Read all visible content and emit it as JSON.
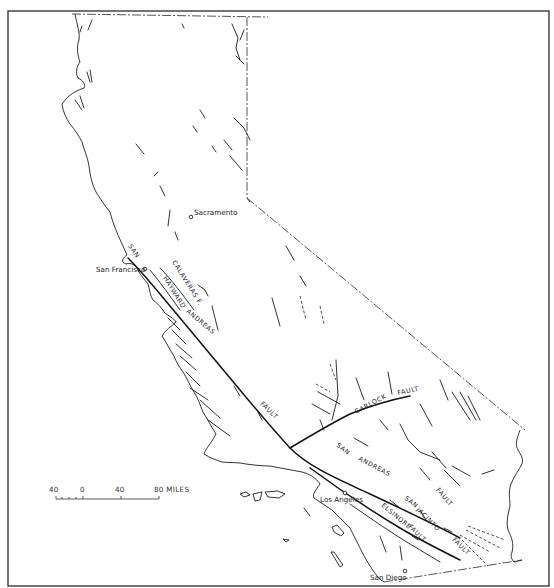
{
  "map": {
    "subject": "California fault map",
    "cities": [
      {
        "id": "sacramento",
        "name": "Sacramento"
      },
      {
        "id": "san-francisco",
        "name": "San Francisco"
      },
      {
        "id": "los-angeles",
        "name": "Los Angeles"
      },
      {
        "id": "san-diego",
        "name": "San Diego"
      }
    ],
    "fault_labels": {
      "san_andreas_north_1": "SAN",
      "san_andreas_north_2": "ANDREAS",
      "san_andreas_north_3": "FAULT",
      "calaveras": "CALAVERAS F.",
      "hayward": "HAYWARD",
      "garlock_1": "GARLOCK",
      "garlock_2": "FAULT",
      "san_andreas_south_1": "SAN",
      "san_andreas_south_2": "ANDREAS",
      "san_andreas_south_3": "FAULT",
      "san_jacinto_1": "SAN",
      "san_jacinto_2": "JACINTO",
      "san_jacinto_3": "FAULT",
      "elsinore_1": "ELSINORE",
      "elsinore_2": "FAULT"
    },
    "scale_bar": {
      "ticks": [
        "40",
        "0",
        "40",
        "80 MILES"
      ],
      "units": "MILES"
    }
  }
}
